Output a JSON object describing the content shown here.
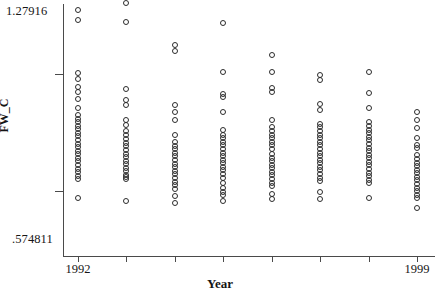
{
  "chart_data": {
    "type": "scatter",
    "title": "",
    "xlabel": "Year",
    "ylabel": "FW_C",
    "ylim": [
      0.574811,
      1.27916
    ],
    "xlim": [
      1991.5,
      1999.5
    ],
    "grid": false,
    "legend": null,
    "y_axis_top_label": "1.27916",
    "y_axis_bottom_label": ".574811",
    "x_tick_labels": [
      "1992",
      "1999"
    ],
    "x_tick_values": [
      1992,
      1999
    ],
    "y_tick_values": [
      1.084,
      0.756
    ],
    "marker": "open-circle",
    "marker_color": "#2b2b2b",
    "categories": [
      1992,
      1993,
      1994,
      1995,
      1996,
      1997,
      1998,
      1999
    ],
    "series": [
      {
        "name": "FW_C by Year",
        "points": [
          {
            "x": 1992,
            "y": 1.2631
          },
          {
            "x": 1992,
            "y": 1.234
          },
          {
            "x": 1992,
            "y": 1.086
          },
          {
            "x": 1992,
            "y": 1.07
          },
          {
            "x": 1992,
            "y": 1.048
          },
          {
            "x": 1992,
            "y": 1.033
          },
          {
            "x": 1992,
            "y": 1.015
          },
          {
            "x": 1992,
            "y": 0.988
          },
          {
            "x": 1992,
            "y": 0.97
          },
          {
            "x": 1992,
            "y": 0.959
          },
          {
            "x": 1992,
            "y": 0.948
          },
          {
            "x": 1992,
            "y": 0.938
          },
          {
            "x": 1992,
            "y": 0.929
          },
          {
            "x": 1992,
            "y": 0.919
          },
          {
            "x": 1992,
            "y": 0.909
          },
          {
            "x": 1992,
            "y": 0.899
          },
          {
            "x": 1992,
            "y": 0.889
          },
          {
            "x": 1992,
            "y": 0.879
          },
          {
            "x": 1992,
            "y": 0.869
          },
          {
            "x": 1992,
            "y": 0.859
          },
          {
            "x": 1992,
            "y": 0.849
          },
          {
            "x": 1992,
            "y": 0.839
          },
          {
            "x": 1992,
            "y": 0.829
          },
          {
            "x": 1992,
            "y": 0.819
          },
          {
            "x": 1992,
            "y": 0.809
          },
          {
            "x": 1992,
            "y": 0.799
          },
          {
            "x": 1992,
            "y": 0.789
          },
          {
            "x": 1992,
            "y": 0.738
          },
          {
            "x": 1993,
            "y": 1.281
          },
          {
            "x": 1993,
            "y": 1.228
          },
          {
            "x": 1993,
            "y": 1.042
          },
          {
            "x": 1993,
            "y": 1.011
          },
          {
            "x": 1993,
            "y": 0.996
          },
          {
            "x": 1993,
            "y": 0.956
          },
          {
            "x": 1993,
            "y": 0.941
          },
          {
            "x": 1993,
            "y": 0.925
          },
          {
            "x": 1993,
            "y": 0.912
          },
          {
            "x": 1993,
            "y": 0.901
          },
          {
            "x": 1993,
            "y": 0.891
          },
          {
            "x": 1993,
            "y": 0.881
          },
          {
            "x": 1993,
            "y": 0.871
          },
          {
            "x": 1993,
            "y": 0.861
          },
          {
            "x": 1993,
            "y": 0.851
          },
          {
            "x": 1993,
            "y": 0.841
          },
          {
            "x": 1993,
            "y": 0.831
          },
          {
            "x": 1993,
            "y": 0.821
          },
          {
            "x": 1993,
            "y": 0.811
          },
          {
            "x": 1993,
            "y": 0.801
          },
          {
            "x": 1993,
            "y": 0.795
          },
          {
            "x": 1993,
            "y": 0.789
          },
          {
            "x": 1993,
            "y": 0.729
          },
          {
            "x": 1994,
            "y": 1.164
          },
          {
            "x": 1994,
            "y": 1.148
          },
          {
            "x": 1994,
            "y": 0.996
          },
          {
            "x": 1994,
            "y": 0.976
          },
          {
            "x": 1994,
            "y": 0.956
          },
          {
            "x": 1994,
            "y": 0.912
          },
          {
            "x": 1994,
            "y": 0.893
          },
          {
            "x": 1994,
            "y": 0.883
          },
          {
            "x": 1994,
            "y": 0.873
          },
          {
            "x": 1994,
            "y": 0.863
          },
          {
            "x": 1994,
            "y": 0.853
          },
          {
            "x": 1994,
            "y": 0.843
          },
          {
            "x": 1994,
            "y": 0.833
          },
          {
            "x": 1994,
            "y": 0.823
          },
          {
            "x": 1994,
            "y": 0.813
          },
          {
            "x": 1994,
            "y": 0.803
          },
          {
            "x": 1994,
            "y": 0.793
          },
          {
            "x": 1994,
            "y": 0.783
          },
          {
            "x": 1994,
            "y": 0.773
          },
          {
            "x": 1994,
            "y": 0.763
          },
          {
            "x": 1994,
            "y": 0.743
          },
          {
            "x": 1994,
            "y": 0.723
          },
          {
            "x": 1995,
            "y": 1.227
          },
          {
            "x": 1995,
            "y": 1.09
          },
          {
            "x": 1995,
            "y": 1.028
          },
          {
            "x": 1995,
            "y": 1.018
          },
          {
            "x": 1995,
            "y": 0.976
          },
          {
            "x": 1995,
            "y": 0.928
          },
          {
            "x": 1995,
            "y": 0.914
          },
          {
            "x": 1995,
            "y": 0.904
          },
          {
            "x": 1995,
            "y": 0.894
          },
          {
            "x": 1995,
            "y": 0.884
          },
          {
            "x": 1995,
            "y": 0.874
          },
          {
            "x": 1995,
            "y": 0.864
          },
          {
            "x": 1995,
            "y": 0.854
          },
          {
            "x": 1995,
            "y": 0.844
          },
          {
            "x": 1995,
            "y": 0.834
          },
          {
            "x": 1995,
            "y": 0.824
          },
          {
            "x": 1995,
            "y": 0.814
          },
          {
            "x": 1995,
            "y": 0.804
          },
          {
            "x": 1995,
            "y": 0.794
          },
          {
            "x": 1995,
            "y": 0.779
          },
          {
            "x": 1995,
            "y": 0.764
          },
          {
            "x": 1995,
            "y": 0.754
          },
          {
            "x": 1995,
            "y": 0.744
          },
          {
            "x": 1995,
            "y": 0.729
          },
          {
            "x": 1996,
            "y": 1.136
          },
          {
            "x": 1996,
            "y": 1.09
          },
          {
            "x": 1996,
            "y": 1.044
          },
          {
            "x": 1996,
            "y": 1.034
          },
          {
            "x": 1996,
            "y": 0.954
          },
          {
            "x": 1996,
            "y": 0.936
          },
          {
            "x": 1996,
            "y": 0.924
          },
          {
            "x": 1996,
            "y": 0.914
          },
          {
            "x": 1996,
            "y": 0.904
          },
          {
            "x": 1996,
            "y": 0.894
          },
          {
            "x": 1996,
            "y": 0.884
          },
          {
            "x": 1996,
            "y": 0.874
          },
          {
            "x": 1996,
            "y": 0.86
          },
          {
            "x": 1996,
            "y": 0.85
          },
          {
            "x": 1996,
            "y": 0.84
          },
          {
            "x": 1996,
            "y": 0.83
          },
          {
            "x": 1996,
            "y": 0.82
          },
          {
            "x": 1996,
            "y": 0.81
          },
          {
            "x": 1996,
            "y": 0.8
          },
          {
            "x": 1996,
            "y": 0.79
          },
          {
            "x": 1996,
            "y": 0.78
          },
          {
            "x": 1996,
            "y": 0.77
          },
          {
            "x": 1996,
            "y": 0.748
          },
          {
            "x": 1996,
            "y": 0.734
          },
          {
            "x": 1997,
            "y": 1.082
          },
          {
            "x": 1997,
            "y": 1.066
          },
          {
            "x": 1997,
            "y": 1.0
          },
          {
            "x": 1997,
            "y": 0.984
          },
          {
            "x": 1997,
            "y": 0.944
          },
          {
            "x": 1997,
            "y": 0.934
          },
          {
            "x": 1997,
            "y": 0.924
          },
          {
            "x": 1997,
            "y": 0.914
          },
          {
            "x": 1997,
            "y": 0.904
          },
          {
            "x": 1997,
            "y": 0.894
          },
          {
            "x": 1997,
            "y": 0.884
          },
          {
            "x": 1997,
            "y": 0.874
          },
          {
            "x": 1997,
            "y": 0.864
          },
          {
            "x": 1997,
            "y": 0.854
          },
          {
            "x": 1997,
            "y": 0.844
          },
          {
            "x": 1997,
            "y": 0.834
          },
          {
            "x": 1997,
            "y": 0.824
          },
          {
            "x": 1997,
            "y": 0.814
          },
          {
            "x": 1997,
            "y": 0.804
          },
          {
            "x": 1997,
            "y": 0.794
          },
          {
            "x": 1997,
            "y": 0.784
          },
          {
            "x": 1997,
            "y": 0.754
          },
          {
            "x": 1997,
            "y": 0.734
          },
          {
            "x": 1998,
            "y": 1.09
          },
          {
            "x": 1998,
            "y": 1.03
          },
          {
            "x": 1998,
            "y": 0.988
          },
          {
            "x": 1998,
            "y": 0.948
          },
          {
            "x": 1998,
            "y": 0.938
          },
          {
            "x": 1998,
            "y": 0.928
          },
          {
            "x": 1998,
            "y": 0.918
          },
          {
            "x": 1998,
            "y": 0.908
          },
          {
            "x": 1998,
            "y": 0.898
          },
          {
            "x": 1998,
            "y": 0.888
          },
          {
            "x": 1998,
            "y": 0.878
          },
          {
            "x": 1998,
            "y": 0.868
          },
          {
            "x": 1998,
            "y": 0.858
          },
          {
            "x": 1998,
            "y": 0.848
          },
          {
            "x": 1998,
            "y": 0.838
          },
          {
            "x": 1998,
            "y": 0.828
          },
          {
            "x": 1998,
            "y": 0.818
          },
          {
            "x": 1998,
            "y": 0.808
          },
          {
            "x": 1998,
            "y": 0.798
          },
          {
            "x": 1998,
            "y": 0.788
          },
          {
            "x": 1998,
            "y": 0.778
          },
          {
            "x": 1998,
            "y": 0.738
          },
          {
            "x": 1999,
            "y": 0.978
          },
          {
            "x": 1999,
            "y": 0.954
          },
          {
            "x": 1999,
            "y": 0.932
          },
          {
            "x": 1999,
            "y": 0.906
          },
          {
            "x": 1999,
            "y": 0.886
          },
          {
            "x": 1999,
            "y": 0.876
          },
          {
            "x": 1999,
            "y": 0.856
          },
          {
            "x": 1999,
            "y": 0.846
          },
          {
            "x": 1999,
            "y": 0.836
          },
          {
            "x": 1999,
            "y": 0.826
          },
          {
            "x": 1999,
            "y": 0.816
          },
          {
            "x": 1999,
            "y": 0.806
          },
          {
            "x": 1999,
            "y": 0.796
          },
          {
            "x": 1999,
            "y": 0.786
          },
          {
            "x": 1999,
            "y": 0.776
          },
          {
            "x": 1999,
            "y": 0.766
          },
          {
            "x": 1999,
            "y": 0.756
          },
          {
            "x": 1999,
            "y": 0.746
          },
          {
            "x": 1999,
            "y": 0.736
          },
          {
            "x": 1999,
            "y": 0.71
          }
        ]
      }
    ]
  },
  "geometry": {
    "plot_left": 63,
    "plot_right": 435,
    "plot_top": 4,
    "plot_bottom": 256,
    "x_first": 78,
    "x_last": 417
  }
}
